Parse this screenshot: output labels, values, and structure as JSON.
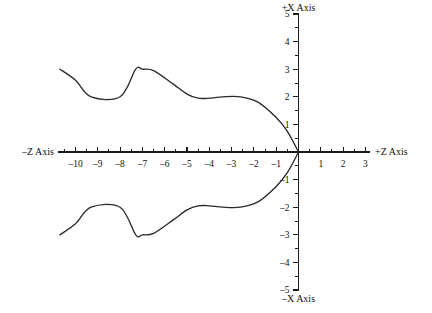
{
  "figure": {
    "background_color": "#ffffff",
    "line_color": "#2a2a2a",
    "axis_color": "#1a1a1a"
  },
  "axes": {
    "horizontal": {
      "name": "Z",
      "label_negative": "–Z Axis",
      "label_positive": "+Z Axis",
      "min": -10.5,
      "max": 3.4,
      "tick_labels": [
        "–10",
        "–9",
        "–8",
        "–7",
        "–6",
        "–5",
        "–4",
        "–3",
        "–2",
        "–1",
        "1",
        "2",
        "3"
      ],
      "tick_values": [
        -10,
        -9,
        -8,
        -7,
        -6,
        -5,
        -4,
        -3,
        -2,
        -1,
        1,
        2,
        3
      ],
      "minor_tick_step": 0.5
    },
    "vertical": {
      "name": "X",
      "label_positive": "+X Axis",
      "label_negative": "–X Axis",
      "min": -5,
      "max": 5,
      "tick_labels": [
        "5",
        "4",
        "3",
        "2",
        "1",
        "–1",
        "–2",
        "–3",
        "–4",
        "–5"
      ],
      "tick_values": [
        5,
        4,
        3,
        2,
        1,
        -1,
        -2,
        -3,
        -4,
        -5
      ],
      "minor_tick_step": 0.5
    }
  },
  "chart_data": {
    "type": "line",
    "title": "",
    "subtitle": "",
    "xlabel": "+Z Axis",
    "ylabel": "+X Axis",
    "xlim": [
      -10.5,
      3.4
    ],
    "ylim": [
      -5,
      5
    ],
    "grid": false,
    "legend": "none",
    "annotations": [],
    "series": [
      {
        "name": "upper-surface",
        "comment": "upper profile contour, Z from -10.7 to 0",
        "x": [
          -10.7,
          -10.0,
          -9.3,
          -8.0,
          -7.3,
          -7.0,
          -6.5,
          -5.6,
          -5.0,
          -4.5,
          -4.0,
          -3.4,
          -2.6,
          -1.8,
          -1.0,
          -0.5,
          0.0
        ],
        "y": [
          3.0,
          2.6,
          2.0,
          2.0,
          3.0,
          3.0,
          2.95,
          2.45,
          2.1,
          1.95,
          1.95,
          2.0,
          2.0,
          1.8,
          1.25,
          0.75,
          0.0
        ]
      },
      {
        "name": "lower-surface",
        "comment": "lower profile contour, Z from -10.7 to 0",
        "x": [
          -10.7,
          -10.0,
          -9.3,
          -8.0,
          -7.3,
          -7.0,
          -6.5,
          -5.6,
          -5.0,
          -4.5,
          -4.0,
          -3.4,
          -2.6,
          -1.8,
          -1.0,
          -0.5,
          0.0
        ],
        "y": [
          -3.0,
          -2.6,
          -2.0,
          -2.0,
          -3.0,
          -3.0,
          -2.95,
          -2.45,
          -2.1,
          -1.95,
          -1.95,
          -2.0,
          -2.0,
          -1.8,
          -1.25,
          -0.75,
          0.0
        ]
      }
    ]
  }
}
